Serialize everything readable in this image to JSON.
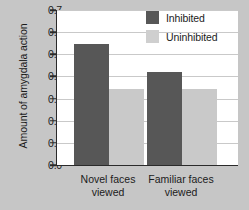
{
  "chart_data": {
    "type": "bar",
    "title": "",
    "xlabel": "",
    "ylabel": "Amount of amygdala action",
    "categories": [
      "Novel faces viewed",
      "Familiar faces viewed"
    ],
    "category_lines": [
      [
        "Novel faces",
        "viewed"
      ],
      [
        "Familiar faces",
        "viewed"
      ]
    ],
    "series": [
      {
        "name": "Inhibited",
        "color": "#575757",
        "values": [
          0.545,
          0.42
        ]
      },
      {
        "name": "Uninhibited",
        "color": "#c9c9c9",
        "values": [
          0.345,
          0.345
        ]
      }
    ],
    "ylim": [
      0.0,
      0.7
    ],
    "ytick_labels": [
      "0.0",
      "0.1",
      "0.2",
      "0.3",
      "0.4",
      "0.5",
      "0.6",
      "0.7"
    ],
    "ytick_values": [
      0.0,
      0.1,
      0.2,
      0.3,
      0.4,
      0.5,
      0.6,
      0.7
    ],
    "grid": true,
    "legend_position": "top-right",
    "legend_entries": [
      "Inhibited",
      "Uninhibited"
    ],
    "background_color": "#c6c6c6",
    "plot_background_color": "#ffffff"
  }
}
